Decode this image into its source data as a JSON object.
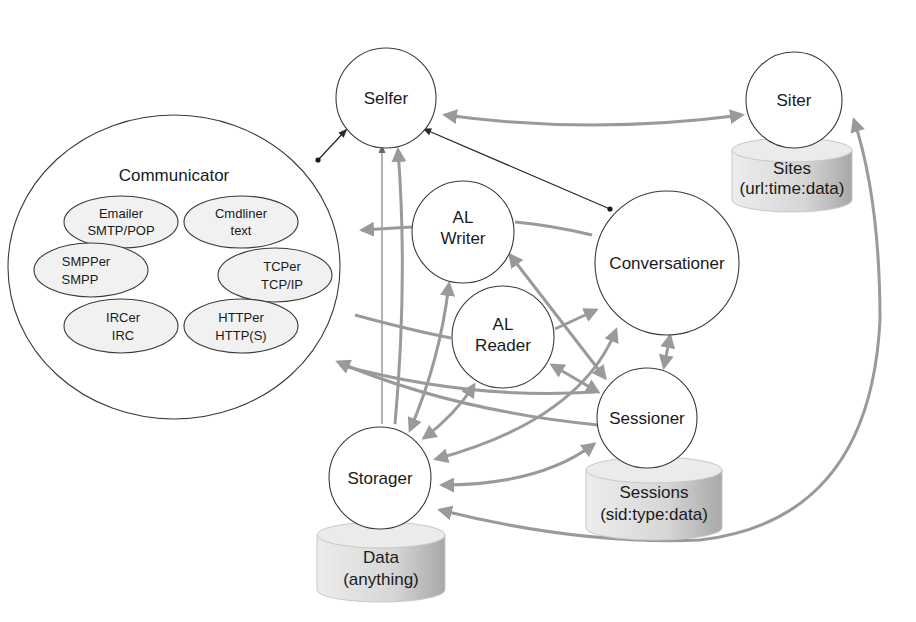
{
  "diagram": {
    "type": "architecture",
    "colors": {
      "node_stroke": "#3a3a3a",
      "arrow_gray": "#9a9a9a",
      "arrow_dark": "#2a2a2a",
      "db_light": "#e8e8e8",
      "db_dark": "#b4b4b4"
    },
    "nodes": {
      "selfer": {
        "label": "Selfer"
      },
      "siter": {
        "label": "Siter"
      },
      "communicator": {
        "label": "Communicator",
        "modules": [
          {
            "name": "Emailer",
            "protocol": "SMTP/POP"
          },
          {
            "name": "Cmdliner",
            "protocol": "text"
          },
          {
            "name": "SMPPer",
            "protocol": "SMPP"
          },
          {
            "name": "TCPer",
            "protocol": "TCP/IP"
          },
          {
            "name": "IRCer",
            "protocol": "IRC"
          },
          {
            "name": "HTTPer",
            "protocol": "HTTP(S)"
          }
        ]
      },
      "al_writer": {
        "line1": "AL",
        "line2": "Writer"
      },
      "al_reader": {
        "line1": "AL",
        "line2": "Reader"
      },
      "conversationer": {
        "label": "Conversationer"
      },
      "sessioner": {
        "label": "Sessioner"
      },
      "storager": {
        "label": "Storager"
      }
    },
    "databases": {
      "sites": {
        "line1": "Sites",
        "line2": "(url:time:data)"
      },
      "sessions": {
        "line1": "Sessions",
        "line2": "(sid:type:data)"
      },
      "data": {
        "line1": "Data",
        "line2": "(anything)"
      }
    },
    "edges": [
      {
        "from": "Selfer",
        "to": "Siter",
        "style": "gray",
        "bidirectional": true
      },
      {
        "from": "Communicator",
        "to": "Selfer",
        "style": "dark"
      },
      {
        "from": "Conversationer",
        "to": "Selfer",
        "style": "dark"
      },
      {
        "from": "Storager",
        "to": "Selfer",
        "style": "thin"
      },
      {
        "from": "Storager",
        "to": "Selfer",
        "style": "gray"
      },
      {
        "from": "AL Writer",
        "to": "Communicator",
        "style": "gray"
      },
      {
        "from": "Conversationer",
        "to": "AL Writer",
        "style": "gray"
      },
      {
        "from": "Communicator",
        "to": "AL Reader",
        "style": "gray"
      },
      {
        "from": "AL Reader",
        "to": "Conversationer",
        "style": "gray"
      },
      {
        "from": "AL Writer",
        "to": "Sessioner",
        "style": "gray",
        "bidirectional": true
      },
      {
        "from": "AL Reader",
        "to": "Sessioner",
        "style": "gray",
        "bidirectional": true
      },
      {
        "from": "Sessioner",
        "to": "Conversationer",
        "style": "gray",
        "bidirectional": true
      },
      {
        "from": "Sessioner",
        "to": "Communicator",
        "style": "gray"
      },
      {
        "from": "Communicator",
        "to": "Sessioner",
        "style": "gray"
      },
      {
        "from": "AL Writer",
        "to": "Storager",
        "style": "gray",
        "bidirectional": true
      },
      {
        "from": "AL Reader",
        "to": "Storager",
        "style": "gray",
        "bidirectional": true
      },
      {
        "from": "Conversationer",
        "to": "Storager",
        "style": "gray",
        "bidirectional": true
      },
      {
        "from": "Sessioner",
        "to": "Storager",
        "style": "gray",
        "bidirectional": true
      },
      {
        "from": "Siter",
        "to": "Storager",
        "style": "gray",
        "bidirectional": true
      },
      {
        "from": "Selfer",
        "to": "Storager",
        "style": "gray"
      }
    ]
  }
}
